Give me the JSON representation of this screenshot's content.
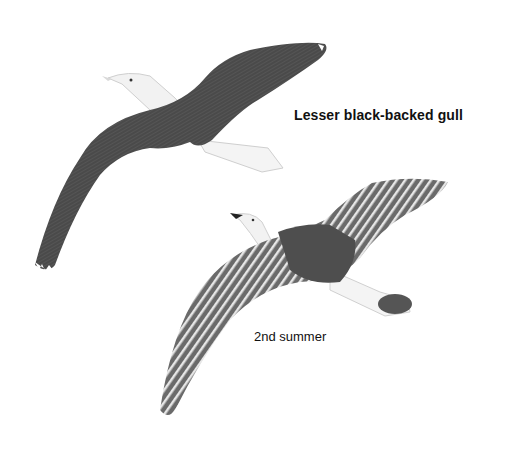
{
  "illustration": {
    "species_label": "Lesser black-backed gull",
    "age_label": "2nd summer",
    "colors": {
      "background": "#ffffff",
      "adult_wing": "#4a4a4a",
      "adult_body": "#f2f2f2",
      "juvenile_wing": "#6a6a6a",
      "juvenile_stripe": "#e6e6e6",
      "text": "#111111"
    },
    "birds": [
      {
        "name": "adult-gull",
        "description": "Adult in flight, dark grey upperwings, white head and tail"
      },
      {
        "name": "second-summer-gull",
        "description": "2nd summer bird in flight, barred brownish-grey wings with dark saddle and dark tail band"
      }
    ]
  }
}
